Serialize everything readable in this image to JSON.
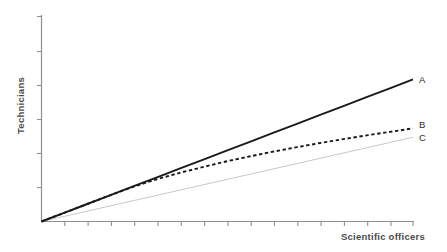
{
  "chart_data": {
    "type": "line",
    "title": "",
    "xlabel": "Scientific officers",
    "ylabel": "Technicians",
    "grid": false,
    "legend_position": "right-end-of-line",
    "axis_ticks_labeled": false,
    "xlim": [
      0,
      16
    ],
    "ylim": [
      0,
      10
    ],
    "x": [
      0,
      1,
      2,
      3,
      4,
      5,
      6,
      7,
      8,
      9,
      10,
      11,
      12,
      13,
      14,
      15,
      16
    ],
    "series": [
      {
        "name": "A",
        "label": "A",
        "style": "solid",
        "color": "#1a1a1a",
        "width": 1.9,
        "values": [
          0,
          0.43,
          0.86,
          1.29,
          1.72,
          2.15,
          2.58,
          3.01,
          3.44,
          3.87,
          4.3,
          4.73,
          5.16,
          5.59,
          6.02,
          6.45,
          6.88
        ]
      },
      {
        "name": "B",
        "label": "B",
        "style": "dashed",
        "color": "#1a1a1a",
        "width": 1.9,
        "values": [
          0,
          0.43,
          0.86,
          1.29,
          1.7,
          2.06,
          2.37,
          2.65,
          2.92,
          3.16,
          3.39,
          3.6,
          3.8,
          3.99,
          4.17,
          4.34,
          4.51
        ]
      },
      {
        "name": "C",
        "label": "C",
        "style": "solid",
        "color": "#c9c9c9",
        "width": 1.0,
        "values": [
          0,
          0.255,
          0.51,
          0.765,
          1.02,
          1.275,
          1.53,
          1.785,
          2.04,
          2.295,
          2.55,
          2.805,
          3.06,
          3.315,
          3.57,
          3.825,
          4.08
        ]
      }
    ],
    "axes": {
      "axis_color": "#8f8f8f",
      "x_tick_count": 16,
      "y_tick_count": 6
    }
  },
  "colors": {
    "background": "#ffffff",
    "axis": "#8f8f8f",
    "series_a": "#1a1a1a",
    "series_b": "#1a1a1a",
    "series_c": "#c9c9c9",
    "text": "#4a4a4a"
  }
}
